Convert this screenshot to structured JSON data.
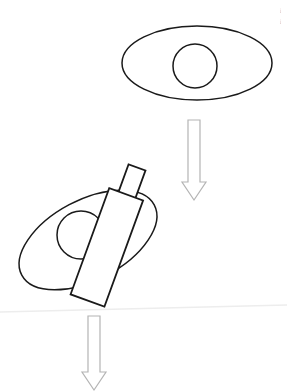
{
  "figure": {
    "background_color": "#ffffff",
    "stroke_color": "#1a1a1a",
    "arrow_stroke_color": "#b0b0b0",
    "fold_line_color": "#ececec",
    "width": 287,
    "height": 392,
    "steps": [
      {
        "index": 1,
        "name": "cell-untouched",
        "label": "",
        "shapes": [
          "outer-ellipse",
          "inner-circle"
        ]
      },
      {
        "index": 2,
        "name": "cell-with-injector",
        "label": "",
        "shapes": [
          "outer-ellipse-tilted",
          "inner-circle-tilted",
          "injector-body",
          "injector-plunger"
        ]
      }
    ],
    "arrows": [
      {
        "name": "arrow-step-1-to-2",
        "direction": "down",
        "label": ""
      },
      {
        "name": "arrow-step-2-to-3",
        "direction": "down",
        "label": ""
      }
    ],
    "top_ellipse": {
      "cx": 197,
      "cy": 63,
      "rx": 75,
      "ry": 37,
      "nucleus_cx": 195,
      "nucleus_cy": 66,
      "nucleus_r": 22
    },
    "bottom_ellipse": {
      "cx": 88,
      "cy": 240,
      "rx": 75,
      "ry": 40,
      "rotation_deg": -28,
      "nucleus_cx": 81,
      "nucleus_cy": 235,
      "nucleus_r": 24
    },
    "injector": {
      "name": "micro-injector",
      "rotation_deg": 20,
      "body": {
        "x": 89,
        "y": 191,
        "width": 36,
        "height": 113
      },
      "plunger": {
        "x": 99,
        "y": 162,
        "width": 18,
        "height": 31
      }
    },
    "arrow_top": {
      "x": 183,
      "y": 120,
      "shaft_width": 10,
      "shaft_height": 62,
      "head_width": 22,
      "head_height": 18
    },
    "arrow_bottom": {
      "x": 83,
      "y": 316,
      "shaft_width": 10,
      "shaft_height": 56,
      "head_width": 22,
      "head_height": 18
    },
    "fold_line": {
      "y_left": 312,
      "y_right": 305
    },
    "edge_marks": [
      {
        "name": "edge-mark-upper",
        "text": "⦙",
        "x": 280,
        "y": 11
      },
      {
        "name": "edge-mark-lower",
        "text": "⦙",
        "x": 280,
        "y": 22
      }
    ]
  }
}
